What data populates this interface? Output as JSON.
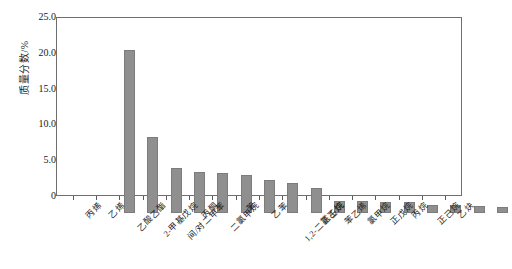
{
  "chart_data": {
    "type": "bar",
    "title": "",
    "xlabel": "",
    "ylabel": "质量分数/%",
    "ylim": [
      0,
      25
    ],
    "yticks": [
      "0",
      "5.0",
      "10.0",
      "15.0",
      "20.0",
      "25.0"
    ],
    "grid": false,
    "legend": "none",
    "bar_color": "#8f8f8f",
    "categories": [
      "丙烯",
      "乙烯",
      "乙酸乙酯",
      "2-甲基戊烷",
      "间/对二甲苯",
      "丙酮",
      "二氯甲烷",
      "苯",
      "乙苯",
      "1,2-二氯乙烷",
      "正壬烷",
      "苯乙烯",
      "氯甲烷",
      "正戊烷",
      "丙烷",
      "正己烷",
      "乙炔"
    ],
    "values": [
      23.0,
      10.8,
      6.4,
      5.8,
      5.6,
      5.3,
      4.6,
      4.3,
      3.6,
      1.7,
      1.7,
      1.6,
      1.5,
      1.2,
      1.1,
      1.0,
      0.8
    ],
    "values_unit": "%"
  },
  "axis": {
    "y_title": "质量分数/%",
    "y_ticks": [
      {
        "label": "25.0",
        "value": 25.0
      },
      {
        "label": "20.0",
        "value": 20.0
      },
      {
        "label": "15.0",
        "value": 15.0
      },
      {
        "label": "10.0",
        "value": 10.0
      },
      {
        "label": "5.0",
        "value": 5.0
      },
      {
        "label": "0",
        "value": 0
      }
    ]
  }
}
